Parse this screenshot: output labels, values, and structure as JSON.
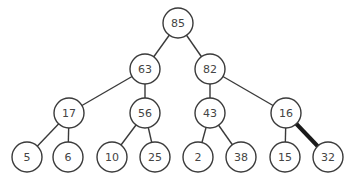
{
  "diagram": {
    "type": "binary-tree",
    "nodes": [
      {
        "id": "n85",
        "label": "85",
        "x": 178,
        "y": 23
      },
      {
        "id": "n63",
        "label": "63",
        "x": 145,
        "y": 69
      },
      {
        "id": "n82",
        "label": "82",
        "x": 210,
        "y": 69
      },
      {
        "id": "n17",
        "label": "17",
        "x": 69,
        "y": 113
      },
      {
        "id": "n56",
        "label": "56",
        "x": 145,
        "y": 113
      },
      {
        "id": "n43",
        "label": "43",
        "x": 210,
        "y": 113
      },
      {
        "id": "n16",
        "label": "16",
        "x": 286,
        "y": 113
      },
      {
        "id": "n5",
        "label": "5",
        "x": 27,
        "y": 157
      },
      {
        "id": "n6",
        "label": "6",
        "x": 68,
        "y": 157
      },
      {
        "id": "n10",
        "label": "10",
        "x": 112,
        "y": 157
      },
      {
        "id": "n25",
        "label": "25",
        "x": 155,
        "y": 157
      },
      {
        "id": "n2",
        "label": "2",
        "x": 198,
        "y": 157
      },
      {
        "id": "n38",
        "label": "38",
        "x": 241,
        "y": 157
      },
      {
        "id": "n15",
        "label": "15",
        "x": 285,
        "y": 157
      },
      {
        "id": "n32",
        "label": "32",
        "x": 328,
        "y": 157
      }
    ],
    "edges": [
      {
        "from": "n85",
        "to": "n63",
        "highlight": false
      },
      {
        "from": "n85",
        "to": "n82",
        "highlight": false
      },
      {
        "from": "n63",
        "to": "n17",
        "highlight": false
      },
      {
        "from": "n63",
        "to": "n56",
        "highlight": false
      },
      {
        "from": "n82",
        "to": "n43",
        "highlight": false
      },
      {
        "from": "n82",
        "to": "n16",
        "highlight": false
      },
      {
        "from": "n17",
        "to": "n5",
        "highlight": false
      },
      {
        "from": "n17",
        "to": "n6",
        "highlight": false
      },
      {
        "from": "n56",
        "to": "n10",
        "highlight": false
      },
      {
        "from": "n56",
        "to": "n25",
        "highlight": false
      },
      {
        "from": "n43",
        "to": "n2",
        "highlight": false
      },
      {
        "from": "n43",
        "to": "n38",
        "highlight": false
      },
      {
        "from": "n16",
        "to": "n15",
        "highlight": false
      },
      {
        "from": "n16",
        "to": "n32",
        "highlight": true
      }
    ],
    "node_radius": 15
  }
}
